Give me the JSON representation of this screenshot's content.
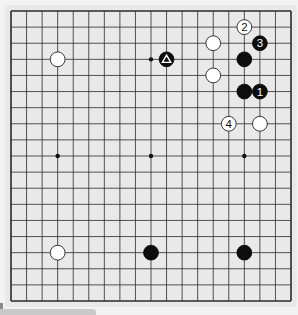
{
  "board": {
    "size": 19,
    "background_color": "#e9e9e9",
    "page_color": "#f3f3f3",
    "line_color": "#2a2a2a",
    "origin": {
      "x": 11,
      "y": 11
    },
    "extent": {
      "x": 291,
      "y": 301
    },
    "star_points": [
      [
        3,
        3
      ],
      [
        9,
        3
      ],
      [
        15,
        3
      ],
      [
        3,
        9
      ],
      [
        9,
        9
      ],
      [
        15,
        9
      ],
      [
        3,
        15
      ],
      [
        9,
        15
      ],
      [
        15,
        15
      ]
    ]
  },
  "stones": [
    {
      "color": "white",
      "col": 3,
      "row": 3,
      "label": ""
    },
    {
      "color": "black",
      "col": 10,
      "row": 3,
      "label": "",
      "marker": "triangle"
    },
    {
      "color": "white",
      "col": 15,
      "row": 1,
      "label": "2"
    },
    {
      "color": "black",
      "col": 16,
      "row": 2,
      "label": "3"
    },
    {
      "color": "white",
      "col": 13,
      "row": 2,
      "label": ""
    },
    {
      "color": "black",
      "col": 15,
      "row": 3,
      "label": ""
    },
    {
      "color": "white",
      "col": 13,
      "row": 4,
      "label": ""
    },
    {
      "color": "black",
      "col": 15,
      "row": 5,
      "label": ""
    },
    {
      "color": "black",
      "col": 16,
      "row": 5,
      "label": "1"
    },
    {
      "color": "white",
      "col": 14,
      "row": 7,
      "label": "4"
    },
    {
      "color": "white",
      "col": 16,
      "row": 7,
      "label": ""
    },
    {
      "color": "white",
      "col": 3,
      "row": 15,
      "label": ""
    },
    {
      "color": "black",
      "col": 9,
      "row": 15,
      "label": ""
    },
    {
      "color": "black",
      "col": 15,
      "row": 15,
      "label": ""
    }
  ]
}
